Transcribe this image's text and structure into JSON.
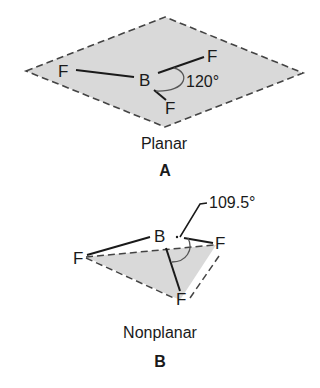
{
  "colors": {
    "plane_fill": "#d9d9d9",
    "line": "#1a1a1a",
    "dash": "#444444",
    "arc": "#555555",
    "background": "#ffffff"
  },
  "panel_a": {
    "label": "A",
    "caption": "Planar",
    "angle_label": "120°",
    "central_atom": "B",
    "atoms": {
      "left": "F",
      "upper_right": "F",
      "bottom": "F"
    }
  },
  "panel_b": {
    "label": "B",
    "caption": "Nonplanar",
    "angle_label": "109.5°",
    "central_atom": "B",
    "atoms": {
      "left": "F",
      "right": "F",
      "bottom": "F"
    }
  }
}
